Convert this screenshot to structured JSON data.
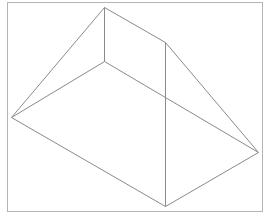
{
  "diagram": {
    "type": "wireframe-solid",
    "colors": {
      "background": "#ffffff",
      "frame": "#b4b4b4",
      "edges": "#8a8a8a"
    },
    "frame": {
      "x": 7,
      "y": 2,
      "width": 255,
      "height": 209
    },
    "vertices": {
      "A": [
        104,
        7
      ],
      "B": [
        165,
        42
      ],
      "C": [
        11,
        117
      ],
      "D": [
        104,
        61
      ],
      "E": [
        258,
        152
      ],
      "F": [
        165,
        206
      ]
    },
    "edges": [
      [
        "A",
        "B"
      ],
      [
        "A",
        "C"
      ],
      [
        "A",
        "D"
      ],
      [
        "D",
        "C"
      ],
      [
        "D",
        "E"
      ],
      [
        "B",
        "E"
      ],
      [
        "B",
        "F"
      ],
      [
        "C",
        "F"
      ],
      [
        "F",
        "E"
      ]
    ]
  }
}
